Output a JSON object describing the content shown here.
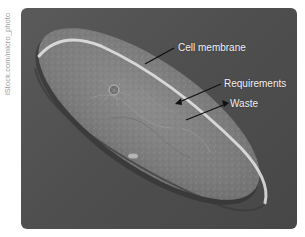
{
  "credit": "iStock.com/micro_photo",
  "figure": {
    "labels": [
      {
        "text": "Cell membrane",
        "x": 178,
        "y": 40
      },
      {
        "text": "Requirements",
        "x": 224,
        "y": 76
      },
      {
        "text": "Waste",
        "x": 230,
        "y": 96
      }
    ]
  },
  "caption": "",
  "colors": {
    "background": "#ffffff",
    "photo_bg": "#505050",
    "label_text": "#f2f2f2",
    "arrow": "#111111"
  }
}
